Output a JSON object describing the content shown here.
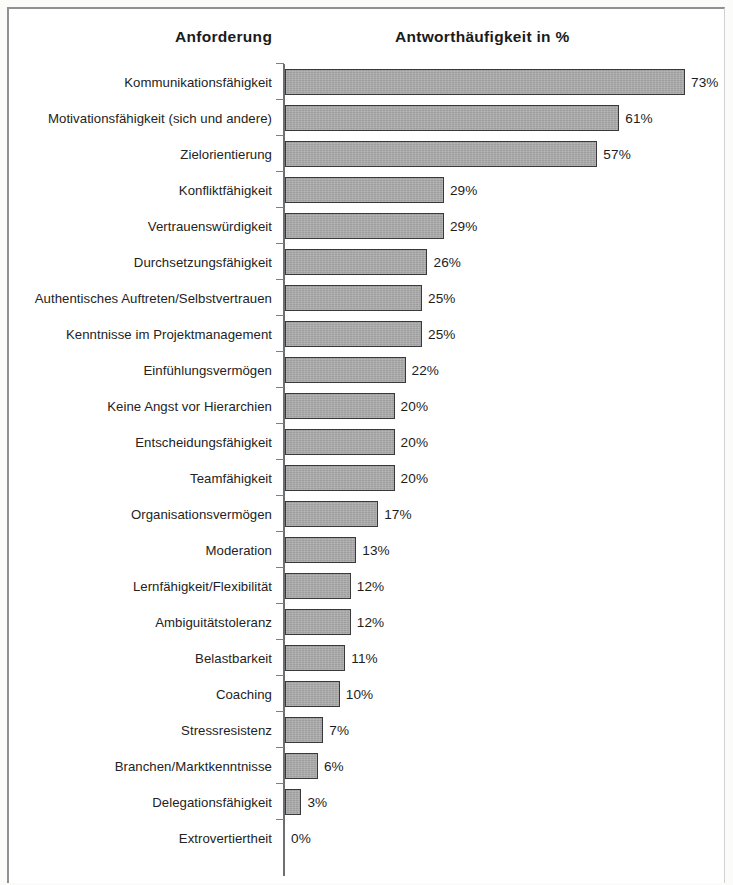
{
  "figure": {
    "background_color": "#ffffff",
    "frame_color": "#8e9094",
    "bar_fill_color": "#a9a9a9",
    "bar_border_color": "#39393b",
    "axis_color": "#6d6f72",
    "text_color": "#232323"
  },
  "headers": {
    "category_header": "Anforderung",
    "value_header": "Antworthäufigkeit in %"
  },
  "chart_data": {
    "type": "bar",
    "orientation": "horizontal",
    "title": "Antworthäufigkeit in %",
    "xlabel": "Antworthäufigkeit in %",
    "ylabel": "Anforderung",
    "xlim": [
      0,
      80
    ],
    "grid": false,
    "legend": null,
    "value_suffix": "%",
    "categories": [
      "Kommunikationsfähigkeit",
      "Motivationsfähigkeit (sich und andere)",
      "Zielorientierung",
      "Konfliktfähigkeit",
      "Vertrauenswürdigkeit",
      "Durchsetzungsfähigkeit",
      "Authentisches Auftreten/Selbstvertrauen",
      "Kenntnisse im Projektmanagement",
      "Einfühlungsvermögen",
      "Keine Angst vor Hierarchien",
      "Entscheidungsfähigkeit",
      "Teamfähigkeit",
      "Organisationsvermögen",
      "Moderation",
      "Lernfähigkeit/Flexibilität",
      "Ambiguitätstoleranz",
      "Belastbarkeit",
      "Coaching",
      "Stressresistenz",
      "Branchen/Marktkenntnisse",
      "Delegationsfähigkeit",
      "Extrovertiertheit"
    ],
    "values": [
      73,
      61,
      57,
      29,
      29,
      26,
      25,
      25,
      22,
      20,
      20,
      20,
      17,
      13,
      12,
      12,
      11,
      10,
      7,
      6,
      3,
      0
    ],
    "data_labels": [
      "73%",
      "61%",
      "57%",
      "29%",
      "29%",
      "26%",
      "25%",
      "25%",
      "22%",
      "20%",
      "20%",
      "20%",
      "17%",
      "13%",
      "12%",
      "12%",
      "11%",
      "10%",
      "7%",
      "6%",
      "3%",
      "0%"
    ]
  }
}
